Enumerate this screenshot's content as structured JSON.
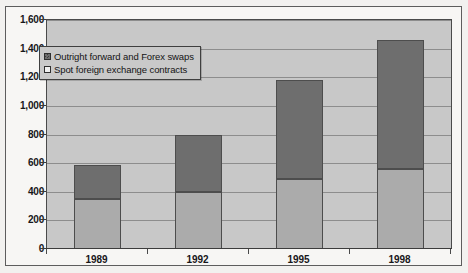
{
  "chart_data": {
    "type": "bar",
    "subtype": "stacked-bar",
    "title": "",
    "xlabel": "",
    "ylabel": "",
    "categories": [
      "1989",
      "1992",
      "1995",
      "1998"
    ],
    "series": [
      {
        "name": "Spot foreign exchange contracts",
        "color": "#ababab",
        "values": [
          350,
          400,
          490,
          560
        ]
      },
      {
        "name": "Outright forward and Forex swaps",
        "color": "#6e6e6e",
        "values": [
          240,
          400,
          690,
          900
        ]
      }
    ],
    "totals": [
      590,
      800,
      1180,
      1460
    ],
    "ylim": [
      0,
      1600
    ],
    "ytick_step": 200,
    "ytick_labels": [
      "1,600",
      "1,400",
      "1,200",
      "1,000",
      "800",
      "600",
      "400",
      "200",
      "0"
    ],
    "ytick_values": [
      1600,
      1400,
      1200,
      1000,
      800,
      600,
      400,
      200,
      0
    ],
    "grid": true,
    "grid_axis": "y",
    "legend_position": "top-left",
    "legend_order": [
      "Outright forward and Forex swaps",
      "Spot foreign exchange contracts"
    ]
  },
  "legend": {
    "items": [
      {
        "label": "Outright forward and Forex swaps",
        "swatch": "dark-hatch-swatch"
      },
      {
        "label": "Spot foreign exchange contracts",
        "swatch": "light-swatch"
      }
    ]
  },
  "colors": {
    "plot_background": "#c8c8c8",
    "page_background": "#f7f6f4",
    "series_dark": "#6e6e6e",
    "series_light": "#ababab",
    "gridline": "#8d8d8d",
    "axis": "#3c3c3c",
    "text": "#17171a"
  }
}
